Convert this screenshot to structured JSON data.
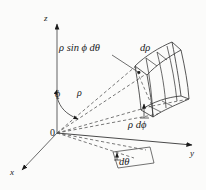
{
  "figure": {
    "background_color": "#fbfbfa",
    "ink_color": "#1a1a1a",
    "width": 206,
    "height": 190
  },
  "axes": {
    "z_label": "z",
    "y_label": "y",
    "x_label": "x",
    "origin_label": "0"
  },
  "labels": {
    "phi": "ϕ",
    "rho": "ρ",
    "rho_sin_phi_dtheta": "ρ sin ϕ dθ",
    "d_rho": "dρ",
    "rho_d_phi": "ρ dϕ",
    "d_theta": "dθ"
  }
}
